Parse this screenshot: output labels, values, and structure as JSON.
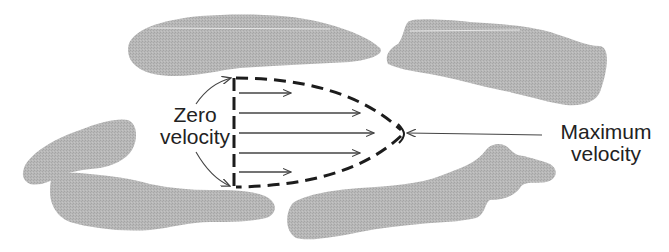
{
  "figure": {
    "colors": {
      "particle_fill": "#b4b4b4",
      "line": "#222222",
      "arrow": "#444444",
      "background": "#ffffff"
    }
  },
  "labels": {
    "zero_velocity": {
      "line1": "Zero",
      "line2": "velocity"
    },
    "maximum_velocity": {
      "line1": "Maximum",
      "line2": "velocity"
    }
  },
  "profile": {
    "shape": "parabolic",
    "boundary_style": "dashed",
    "velocity_arrows": [
      {
        "y": 93,
        "length": "short"
      },
      {
        "y": 113,
        "length": "long"
      },
      {
        "y": 133,
        "length": "longest"
      },
      {
        "y": 153,
        "length": "long"
      },
      {
        "y": 172,
        "length": "short"
      }
    ]
  },
  "particles": [
    {
      "id": "top-left-grain"
    },
    {
      "id": "top-right-grain"
    },
    {
      "id": "middle-left-grain"
    },
    {
      "id": "bottom-left-grain"
    },
    {
      "id": "bottom-right-grain"
    }
  ]
}
